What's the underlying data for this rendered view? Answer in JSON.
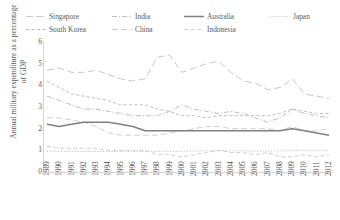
{
  "chart_data": {
    "type": "line",
    "title": "",
    "xlabel": "",
    "ylabel": "Annual military expenditure as a percentage of GDP",
    "ylim": [
      0,
      6
    ],
    "yticks": [
      0,
      1,
      2,
      3,
      4,
      5,
      6
    ],
    "grid": false,
    "legend_position": "top",
    "x": [
      1989,
      1990,
      1991,
      1992,
      1993,
      1994,
      1995,
      1996,
      1997,
      1998,
      1999,
      2000,
      2001,
      2002,
      2003,
      2004,
      2005,
      2006,
      2007,
      2008,
      2009,
      2010,
      2011,
      2012
    ],
    "categories": [
      "1989",
      "1990",
      "1991",
      "1992",
      "1993",
      "1994",
      "1995",
      "1996",
      "1997",
      "1998",
      "1999",
      "2000",
      "2001",
      "2002",
      "2003",
      "2004",
      "2005",
      "2006",
      "2007",
      "2008",
      "2009",
      "2010",
      "2011",
      "2012"
    ],
    "series": [
      {
        "name": "Singapore",
        "style": "long-dash",
        "color": "#c8c8c8",
        "values": [
          4.7,
          4.8,
          4.6,
          4.6,
          4.7,
          4.5,
          4.3,
          4.2,
          4.3,
          5.3,
          5.4,
          4.6,
          4.8,
          5.0,
          5.1,
          4.6,
          4.2,
          4.1,
          3.8,
          3.9,
          4.3,
          3.6,
          3.5,
          3.4
        ]
      },
      {
        "name": "South Korea",
        "style": "dash",
        "color": "#bfbfbf",
        "values": [
          4.2,
          3.9,
          3.6,
          3.5,
          3.4,
          3.3,
          3.1,
          3.1,
          3.1,
          2.9,
          2.8,
          2.6,
          2.6,
          2.5,
          2.6,
          2.6,
          2.6,
          2.6,
          2.6,
          2.7,
          2.9,
          2.8,
          2.7,
          2.7
        ]
      },
      {
        "name": "India",
        "style": "dash-dot",
        "color": "#bdbdbd",
        "values": [
          3.5,
          3.3,
          3.1,
          2.9,
          2.9,
          2.8,
          2.7,
          2.6,
          2.6,
          2.6,
          2.8,
          3.1,
          2.9,
          2.8,
          2.7,
          2.8,
          2.7,
          2.5,
          2.3,
          2.5,
          2.9,
          2.7,
          2.6,
          2.5
        ]
      },
      {
        "name": "China",
        "style": "long-dash-low",
        "color": "#d0d0d0",
        "values": [
          2.5,
          2.5,
          2.4,
          2.3,
          2.1,
          1.8,
          1.7,
          1.7,
          1.7,
          1.7,
          1.8,
          1.9,
          2.0,
          2.1,
          2.1,
          2.0,
          2.0,
          2.0,
          2.0,
          1.9,
          2.1,
          1.9,
          1.9,
          2.0
        ]
      },
      {
        "name": "Australia",
        "style": "solid",
        "color": "#808080",
        "values": [
          2.2,
          2.1,
          2.2,
          2.3,
          2.3,
          2.3,
          2.2,
          2.1,
          1.9,
          1.9,
          1.9,
          1.9,
          1.9,
          1.9,
          1.9,
          1.9,
          1.9,
          1.9,
          1.9,
          1.9,
          2.0,
          1.9,
          1.8,
          1.7
        ]
      },
      {
        "name": "Indonesia",
        "style": "med-dash",
        "color": "#cfcfcf",
        "values": [
          1.2,
          1.1,
          1.1,
          1.1,
          1.1,
          1.0,
          1.0,
          1.0,
          1.0,
          0.8,
          0.8,
          0.7,
          0.8,
          0.9,
          1.0,
          0.9,
          0.9,
          0.8,
          0.9,
          0.7,
          0.7,
          0.8,
          0.7,
          0.8
        ]
      },
      {
        "name": "Japan",
        "style": "dot",
        "color": "#c4c4c4",
        "values": [
          0.95,
          0.95,
          0.95,
          0.95,
          0.95,
          0.95,
          0.95,
          0.95,
          0.95,
          0.95,
          0.95,
          0.95,
          0.97,
          0.98,
          0.98,
          0.98,
          0.98,
          0.97,
          0.97,
          0.97,
          1.0,
          1.0,
          1.0,
          1.0
        ]
      }
    ],
    "legend": [
      {
        "label": "Singapore",
        "style": "long-dash"
      },
      {
        "label": "South Korea",
        "style": "dash"
      },
      {
        "label": "India",
        "style": "dash-dot"
      },
      {
        "label": "China",
        "style": "long-dash-low"
      },
      {
        "label": "Australia",
        "style": "solid"
      },
      {
        "label": "Indonesia",
        "style": "med-dash"
      },
      {
        "label": "Japan",
        "style": "dot"
      }
    ]
  }
}
